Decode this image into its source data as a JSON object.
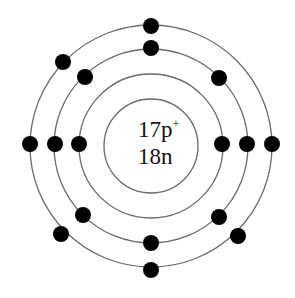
{
  "diagram": {
    "nucleus": {
      "protons_label": "17p",
      "protons_charge": "+",
      "neutrons_label": "18n"
    },
    "center": [
      151,
      146
    ],
    "line_color": "#6a6a6a",
    "electron_color": "#000000",
    "shells": [
      {
        "radius": 47,
        "electrons": []
      },
      {
        "radius": 72,
        "electrons": [
          [
            79,
            144
          ],
          [
            222,
            144
          ]
        ]
      },
      {
        "radius": 97,
        "electrons": [
          [
            151,
            48
          ],
          [
            219,
            78
          ],
          [
            247,
            144
          ],
          [
            219,
            217
          ],
          [
            151,
            243
          ],
          [
            83,
            215
          ],
          [
            55,
            144
          ],
          [
            85,
            77
          ]
        ]
      },
      {
        "radius": 121,
        "electrons": [
          [
            151,
            26
          ],
          [
            272,
            144
          ],
          [
            238,
            236
          ],
          [
            151,
            270
          ],
          [
            61,
            234
          ],
          [
            30,
            144
          ],
          [
            63,
            62
          ]
        ]
      }
    ]
  }
}
